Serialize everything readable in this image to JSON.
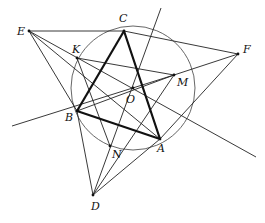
{
  "figure": {
    "width": 265,
    "height": 223,
    "points": {
      "A": {
        "x": 160,
        "y": 139,
        "label": "A",
        "lx": 157,
        "ly": 152
      },
      "B": {
        "x": 77,
        "y": 111,
        "label": "B",
        "lx": 65,
        "ly": 121
      },
      "C": {
        "x": 124,
        "y": 31,
        "label": "C",
        "lx": 119,
        "ly": 22
      },
      "D": {
        "x": 93,
        "y": 195,
        "label": "D",
        "lx": 91,
        "ly": 210
      },
      "E": {
        "x": 29,
        "y": 31,
        "label": "E",
        "lx": 17,
        "ly": 35
      },
      "F": {
        "x": 238,
        "y": 54,
        "label": "F",
        "lx": 243,
        "ly": 53
      },
      "K": {
        "x": 77,
        "y": 58,
        "label": "K",
        "lx": 72,
        "ly": 53
      },
      "M": {
        "x": 174,
        "y": 75,
        "label": "M",
        "lx": 177,
        "ly": 86
      },
      "N": {
        "x": 110,
        "y": 146,
        "label": "N",
        "lx": 112,
        "ly": 158
      },
      "O": {
        "x": 133,
        "y": 88,
        "label": "O",
        "lx": 126,
        "ly": 103
      }
    },
    "circle": {
      "cx": 133,
      "cy": 88,
      "r": 62
    },
    "thick_segments": [
      [
        "A",
        "B"
      ],
      [
        "B",
        "C"
      ],
      [
        "C",
        "A"
      ]
    ],
    "thin_segments": [
      [
        "E",
        "C"
      ],
      [
        "C",
        "F"
      ],
      [
        "E",
        "B"
      ],
      [
        "E",
        "A"
      ],
      [
        "F",
        "A"
      ],
      [
        "F",
        "M"
      ],
      [
        "B",
        "D"
      ],
      [
        "D",
        "A"
      ],
      [
        "D",
        "M"
      ],
      [
        "K",
        "M"
      ],
      [
        "K",
        "N"
      ],
      [
        "B",
        "M"
      ]
    ],
    "rays": [
      {
        "x1": 12,
        "y1": 126,
        "x2": 174,
        "y2": 75
      },
      {
        "x1": 161,
        "y1": 8,
        "x2": 93,
        "y2": 195
      },
      {
        "x1": 29,
        "y1": 31,
        "x2": 256,
        "y2": 157
      }
    ]
  }
}
